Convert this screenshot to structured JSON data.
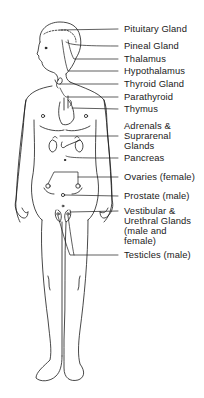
{
  "diagram": {
    "type": "anatomical line drawing",
    "colors": {
      "line": "#1a1a1a",
      "background": "#ffffff"
    }
  },
  "labels": [
    {
      "id": "pituitary",
      "lines": [
        "Pituitary Gland"
      ],
      "y": 24
    },
    {
      "id": "pineal",
      "lines": [
        "Pineal Gland"
      ],
      "y": 41
    },
    {
      "id": "thalamus",
      "lines": [
        "Thalamus"
      ],
      "y": 54
    },
    {
      "id": "hypothalamus",
      "lines": [
        "Hypothalamus"
      ],
      "y": 66
    },
    {
      "id": "thyroid",
      "lines": [
        "Thyroid Gland"
      ],
      "y": 79
    },
    {
      "id": "parathyroid",
      "lines": [
        "Parathyroid"
      ],
      "y": 92
    },
    {
      "id": "thymus",
      "lines": [
        "Thymus"
      ],
      "y": 104
    },
    {
      "id": "adrenals",
      "lines": [
        "Adrenals &",
        "Suprarenal",
        "Glands"
      ],
      "y": 121
    },
    {
      "id": "pancreas",
      "lines": [
        "Pancreas"
      ],
      "y": 153
    },
    {
      "id": "ovaries",
      "lines": [
        "Ovaries (female)"
      ],
      "y": 172
    },
    {
      "id": "prostate",
      "lines": [
        "Prostate (male)"
      ],
      "y": 191
    },
    {
      "id": "vestibular",
      "lines": [
        "Vestibular &",
        "Urethral Glands",
        "(male and",
        "female)"
      ],
      "y": 206
    },
    {
      "id": "testicles",
      "lines": [
        "Testicles (male)"
      ],
      "y": 250
    }
  ]
}
